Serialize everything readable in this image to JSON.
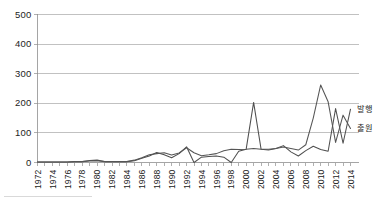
{
  "chart_data": {
    "type": "line",
    "title": "",
    "subtitle": "",
    "xlabel": "",
    "ylabel": "",
    "xlim": [
      1972,
      2014
    ],
    "ylim": [
      0,
      500
    ],
    "yticks": [
      0,
      100,
      200,
      300,
      400,
      500
    ],
    "ytick_labels": [
      "0",
      "100",
      "200",
      "300",
      "400",
      "500"
    ],
    "grid": true,
    "grid_axis": "y",
    "legend_position": "right-inline-at-line-end",
    "x": [
      1972,
      1973,
      1974,
      1975,
      1976,
      1977,
      1978,
      1979,
      1980,
      1981,
      1982,
      1983,
      1984,
      1985,
      1986,
      1987,
      1988,
      1989,
      1990,
      1991,
      1992,
      1993,
      1994,
      1995,
      1996,
      1997,
      1998,
      1999,
      2000,
      2001,
      2002,
      2003,
      2004,
      2005,
      2006,
      2007,
      2008,
      2009,
      2010,
      2011,
      2012,
      2013,
      2014
    ],
    "xtick_labels": [
      "1972",
      "1974",
      "1976",
      "1978",
      "1980",
      "1982",
      "1984",
      "1986",
      "1988",
      "1990",
      "1992",
      "1994",
      "1996",
      "1998",
      "2000",
      "2002",
      "2004",
      "2006",
      "2008",
      "2010",
      "2012",
      "2014"
    ],
    "xtick_step": 2,
    "series": [
      {
        "name": "발행",
        "label_at_end": "발행",
        "color": "#4f4f4f",
        "end_value": 180,
        "values": [
          2,
          2,
          2,
          2,
          2,
          3,
          3,
          7,
          8,
          3,
          3,
          3,
          3,
          6,
          14,
          22,
          34,
          26,
          16,
          30,
          53,
          0,
          18,
          20,
          22,
          18,
          0,
          38,
          45,
          203,
          45,
          42,
          47,
          57,
          36,
          22,
          40,
          55,
          44,
          38,
          182,
          65,
          180
        ]
      },
      {
        "name": "출원",
        "label_at_end": "출원",
        "color": "#555555",
        "end_value": 115,
        "values": [
          2,
          2,
          2,
          2,
          2,
          3,
          3,
          5,
          6,
          3,
          3,
          3,
          3,
          8,
          16,
          26,
          30,
          33,
          25,
          32,
          50,
          33,
          23,
          26,
          30,
          40,
          45,
          44,
          45,
          47,
          45,
          45,
          47,
          52,
          47,
          42,
          60,
          150,
          262,
          205,
          68,
          160,
          115
        ]
      }
    ],
    "annotations": [
      {
        "text": "203 spike",
        "x": 2001,
        "y": 203
      },
      {
        "text": "500 spike",
        "x": 2013,
        "y": 500
      }
    ]
  },
  "legend": {
    "entries": [
      {
        "label": "발행"
      },
      {
        "label": "출원"
      }
    ]
  },
  "axis": {
    "y": {
      "ticks": [
        "0",
        "100",
        "200",
        "300",
        "400",
        "500"
      ]
    },
    "x": {
      "ticks": [
        "1972",
        "1974",
        "1976",
        "1978",
        "1980",
        "1982",
        "1984",
        "1986",
        "1988",
        "1990",
        "1992",
        "1994",
        "1996",
        "1998",
        "2000",
        "2002",
        "2004",
        "2006",
        "2008",
        "2010",
        "2012",
        "2014"
      ]
    }
  }
}
